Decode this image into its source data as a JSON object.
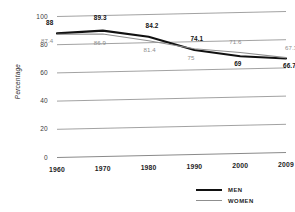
{
  "chart_data": {
    "type": "line",
    "title": "",
    "xlabel": "",
    "ylabel": "Percentage",
    "categories": [
      "1960",
      "1970",
      "1980",
      "1990",
      "2000",
      "2009"
    ],
    "ylim": [
      0,
      100
    ],
    "yticks": [
      "0",
      "20",
      "40",
      "60",
      "80",
      "100"
    ],
    "grid": true,
    "legend_position": "bottom-right",
    "series": [
      {
        "name": "MEN",
        "color": "#111111",
        "values": [
          88,
          89.3,
          84.2,
          74.1,
          69,
          66.7
        ],
        "labels": [
          "88",
          "89.3",
          "84.2",
          "74.1",
          "69",
          "66.7"
        ]
      },
      {
        "name": "WOMEN",
        "color": "#8f8f8f",
        "values": [
          87.4,
          86.9,
          81.4,
          75,
          71.6,
          67.3
        ],
        "labels": [
          "87.4",
          "86.9",
          "81.4",
          "75",
          "71.6",
          "67.3"
        ]
      }
    ]
  },
  "legend": {
    "men_label": "MEN",
    "women_label": "WOMEN"
  }
}
